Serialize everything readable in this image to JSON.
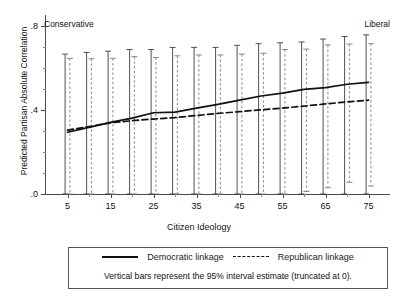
{
  "chart_data": {
    "type": "line",
    "title": "",
    "xlabel": "Citizen Ideology",
    "ylabel": "Predicted Partisan Absolute Correlation",
    "xlim": [
      0,
      80
    ],
    "ylim": [
      0.0,
      0.85
    ],
    "yticks": [
      0.0,
      0.4,
      0.8
    ],
    "ytick_labels": [
      ".0",
      ".4",
      ".8"
    ],
    "y_minor_ticks": [
      0.1,
      0.2,
      0.3,
      0.5,
      0.6,
      0.7
    ],
    "xticks": [
      5,
      15,
      25,
      35,
      45,
      55,
      65,
      75
    ],
    "xtick_labels": [
      "5",
      "15",
      "25",
      "35",
      "45",
      "55",
      "65",
      "75"
    ],
    "x_minor_ticks": [
      10,
      20,
      30,
      40,
      50,
      60,
      70
    ],
    "x_axis_end_labels": {
      "left": "Conservative",
      "right": "Liberal"
    },
    "x": [
      5,
      10,
      15,
      20,
      25,
      30,
      35,
      40,
      45,
      50,
      55,
      60,
      65,
      70,
      75
    ],
    "grid": false,
    "legend_position": "below-plot",
    "error_bar_note": "Vertical bars represent the 95% interval estimate (truncated at 0).",
    "series": [
      {
        "name": "Democratic linkage",
        "style": "solid",
        "color": "#111111",
        "values": [
          0.295,
          0.318,
          0.342,
          0.362,
          0.388,
          0.391,
          0.41,
          0.428,
          0.448,
          0.468,
          0.482,
          0.5,
          0.508,
          0.524,
          0.533
        ],
        "ci_lower": [
          0.0,
          0.0,
          0.0,
          0.0,
          0.0,
          0.0,
          0.0,
          0.0,
          0.0,
          0.0,
          0.0,
          0.0,
          0.0,
          0.0,
          0.0
        ],
        "ci_upper": [
          0.668,
          0.676,
          0.682,
          0.69,
          0.69,
          0.7,
          0.7,
          0.7,
          0.71,
          0.718,
          0.722,
          0.726,
          0.74,
          0.752,
          0.76
        ]
      },
      {
        "name": "Republican linkage",
        "style": "dashed",
        "color": "#111111",
        "values": [
          0.305,
          0.322,
          0.34,
          0.35,
          0.358,
          0.365,
          0.375,
          0.385,
          0.393,
          0.402,
          0.41,
          0.42,
          0.43,
          0.44,
          0.448
        ],
        "ci_lower": [
          0.0,
          0.0,
          0.0,
          0.0,
          0.0,
          0.0,
          0.0,
          0.0,
          0.0,
          0.0,
          0.0,
          0.012,
          0.03,
          0.056,
          0.038
        ],
        "ci_upper": [
          0.648,
          0.646,
          0.648,
          0.656,
          0.652,
          0.66,
          0.664,
          0.664,
          0.668,
          0.672,
          0.69,
          0.692,
          0.712,
          0.716,
          0.718
        ]
      }
    ]
  },
  "legend": {
    "democratic_label": "Democratic linkage",
    "republican_label": "Republican linkage",
    "note": "Vertical bars represent the 95% interval estimate (truncated at 0)."
  },
  "axes": {
    "y_title": "Predicted Partisan Absolute Correlation",
    "x_title": "Citizen Ideology",
    "left_anchor": "Conservative",
    "right_anchor": "Liberal"
  }
}
